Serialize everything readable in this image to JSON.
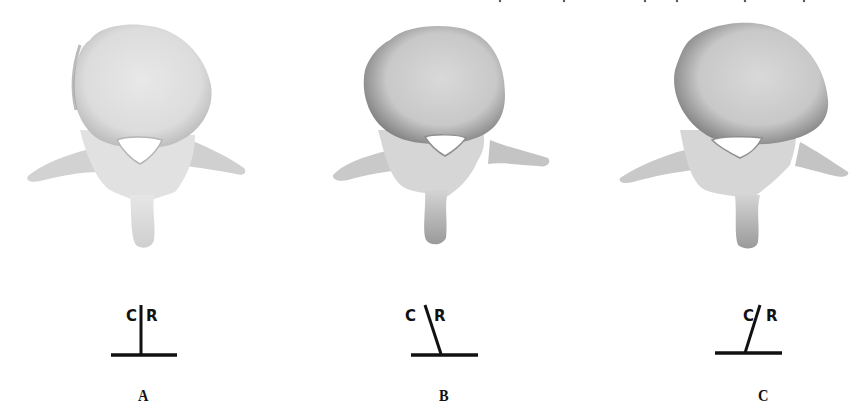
{
  "figure": {
    "panels": [
      {
        "id": "A",
        "label": "A",
        "diagram": {
          "left_letter": "C",
          "right_letter": "R",
          "tilt": "vertical"
        }
      },
      {
        "id": "B",
        "label": "B",
        "diagram": {
          "left_letter": "C",
          "right_letter": "R",
          "tilt": "leaning-left"
        }
      },
      {
        "id": "C",
        "label": "C",
        "diagram": {
          "left_letter": "C",
          "right_letter": "R",
          "tilt": "leaning-right"
        }
      }
    ],
    "colors": {
      "bone_light": "#e9e9e9",
      "bone_mid": "#c9c9c9",
      "bone_dark": "#8f8f8f",
      "ink": "#111111",
      "background": "#ffffff"
    }
  }
}
